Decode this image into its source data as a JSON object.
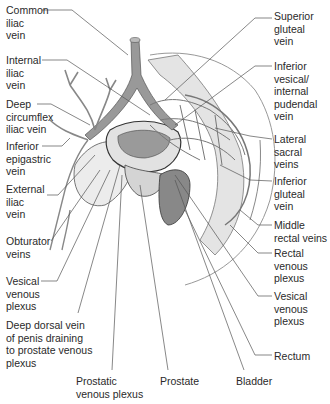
{
  "labels_left": [
    {
      "id": "common-iliac-vein",
      "text": "Common\niliac\nvein",
      "x": 6,
      "y": 5
    },
    {
      "id": "internal-iliac-vein",
      "text": "Internal\niliac\nvein",
      "x": 6,
      "y": 55
    },
    {
      "id": "deep-circumflex-iliac-vein",
      "text": "Deep\ncircumflex\niliac vein",
      "x": 6,
      "y": 98
    },
    {
      "id": "inferior-epigastric-vein",
      "text": "Inferior\nepigastric\nvein",
      "x": 6,
      "y": 140
    },
    {
      "id": "external-iliac-vein",
      "text": "External\niliac\nvein",
      "x": 6,
      "y": 183
    },
    {
      "id": "obturator-veins",
      "text": "Obturator\nveins",
      "x": 6,
      "y": 236
    },
    {
      "id": "vesical-venous-plexus-left",
      "text": "Vesical\nvenous\nplexus",
      "x": 6,
      "y": 274
    },
    {
      "id": "deep-dorsal-vein",
      "text": "Deep dorsal vein\nof penis draining\nto prostate venous\nplexus",
      "x": 6,
      "y": 318
    }
  ],
  "labels_right": [
    {
      "id": "superior-gluteal-vein",
      "text": "Superior\ngluteal\nvein",
      "x": 274,
      "y": 10
    },
    {
      "id": "inferior-vesical-pudendal-vein",
      "text": "Inferior\nvesical/\ninternal\npudendal\nvein",
      "x": 274,
      "y": 64
    },
    {
      "id": "lateral-sacral-veins",
      "text": "Lateral\nsacral\nveins",
      "x": 274,
      "y": 133
    },
    {
      "id": "inferior-gluteal-vein",
      "text": "Inferior\ngluteal\nvein",
      "x": 274,
      "y": 175
    },
    {
      "id": "middle-rectal-veins",
      "text": "Middle\nrectal veins",
      "x": 274,
      "y": 219
    },
    {
      "id": "rectal-venous-plexus",
      "text": "Rectal\nvenous\nplexus",
      "x": 274,
      "y": 247
    },
    {
      "id": "vesical-venous-plexus-right",
      "text": "Vesical\nvenous\nplexus",
      "x": 274,
      "y": 290
    },
    {
      "id": "rectum",
      "text": "Rectum",
      "x": 274,
      "y:": 0,
      "y2": 0
    }
  ],
  "labels_bottom": [
    {
      "id": "prostatic-venous-plexus",
      "text": "Prostatic\nvenous plexus",
      "x": 76,
      "y": 375
    },
    {
      "id": "prostate",
      "text": "Prostate",
      "x": 160,
      "y": 375
    },
    {
      "id": "bladder",
      "text": "Bladder",
      "x": 236,
      "y": 375
    }
  ],
  "rectum_label": {
    "text": "Rectum",
    "x": 274,
    "y": 352
  },
  "colors": {
    "line": "#4a4a4a",
    "vein": "#8a8a8a",
    "tissue": "#d9d9d9",
    "text": "#2a2a2a"
  }
}
